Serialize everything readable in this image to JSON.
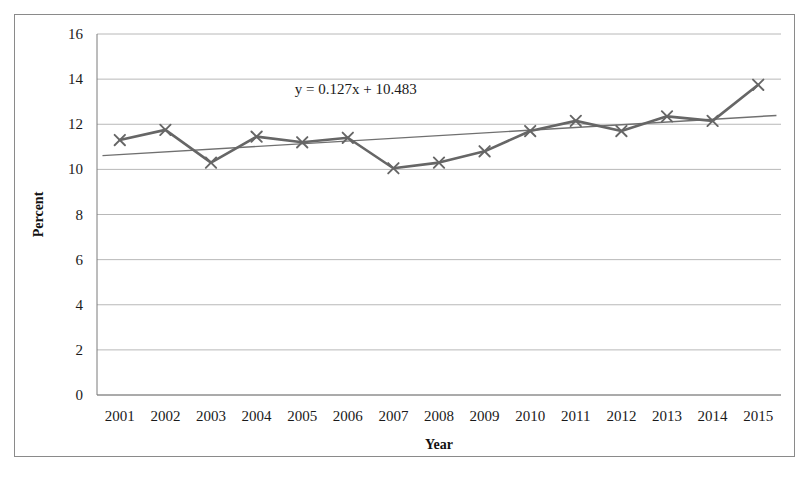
{
  "chart_data": {
    "type": "line",
    "title": "",
    "xlabel": "Year",
    "ylabel": "Percent",
    "categories": [
      "2001",
      "2002",
      "2003",
      "2004",
      "2005",
      "2006",
      "2007",
      "2008",
      "2009",
      "2010",
      "2011",
      "2012",
      "2013",
      "2014",
      "2015"
    ],
    "values": [
      11.3,
      11.75,
      10.3,
      11.45,
      11.2,
      11.4,
      10.05,
      10.3,
      10.8,
      11.7,
      12.15,
      11.7,
      12.35,
      12.15,
      13.75
    ],
    "series": [
      {
        "name": "Percent",
        "values": [
          11.3,
          11.75,
          10.3,
          11.45,
          11.2,
          11.4,
          10.05,
          10.3,
          10.8,
          11.7,
          12.15,
          11.7,
          12.35,
          12.15,
          13.75
        ],
        "color": "#666666",
        "marker": "x"
      }
    ],
    "trendline": {
      "equation": "y = 0.127x + 10.483",
      "slope": 0.127,
      "intercept": 10.483,
      "color": "#707070",
      "start_value": 10.61,
      "end_value": 12.39
    },
    "ylim": [
      0,
      16
    ],
    "yticks": [
      0,
      2,
      4,
      6,
      8,
      10,
      12,
      14,
      16
    ],
    "ytick_labels": [
      "0",
      "2",
      "4",
      "6",
      "8",
      "10",
      "12",
      "14",
      "16"
    ],
    "grid": "horizontal",
    "legend": "none",
    "gridline_color": "#b8b8b8",
    "axis_color": "#7a7a7a",
    "background": "#ffffff",
    "border_color": "#8a8a8a"
  }
}
